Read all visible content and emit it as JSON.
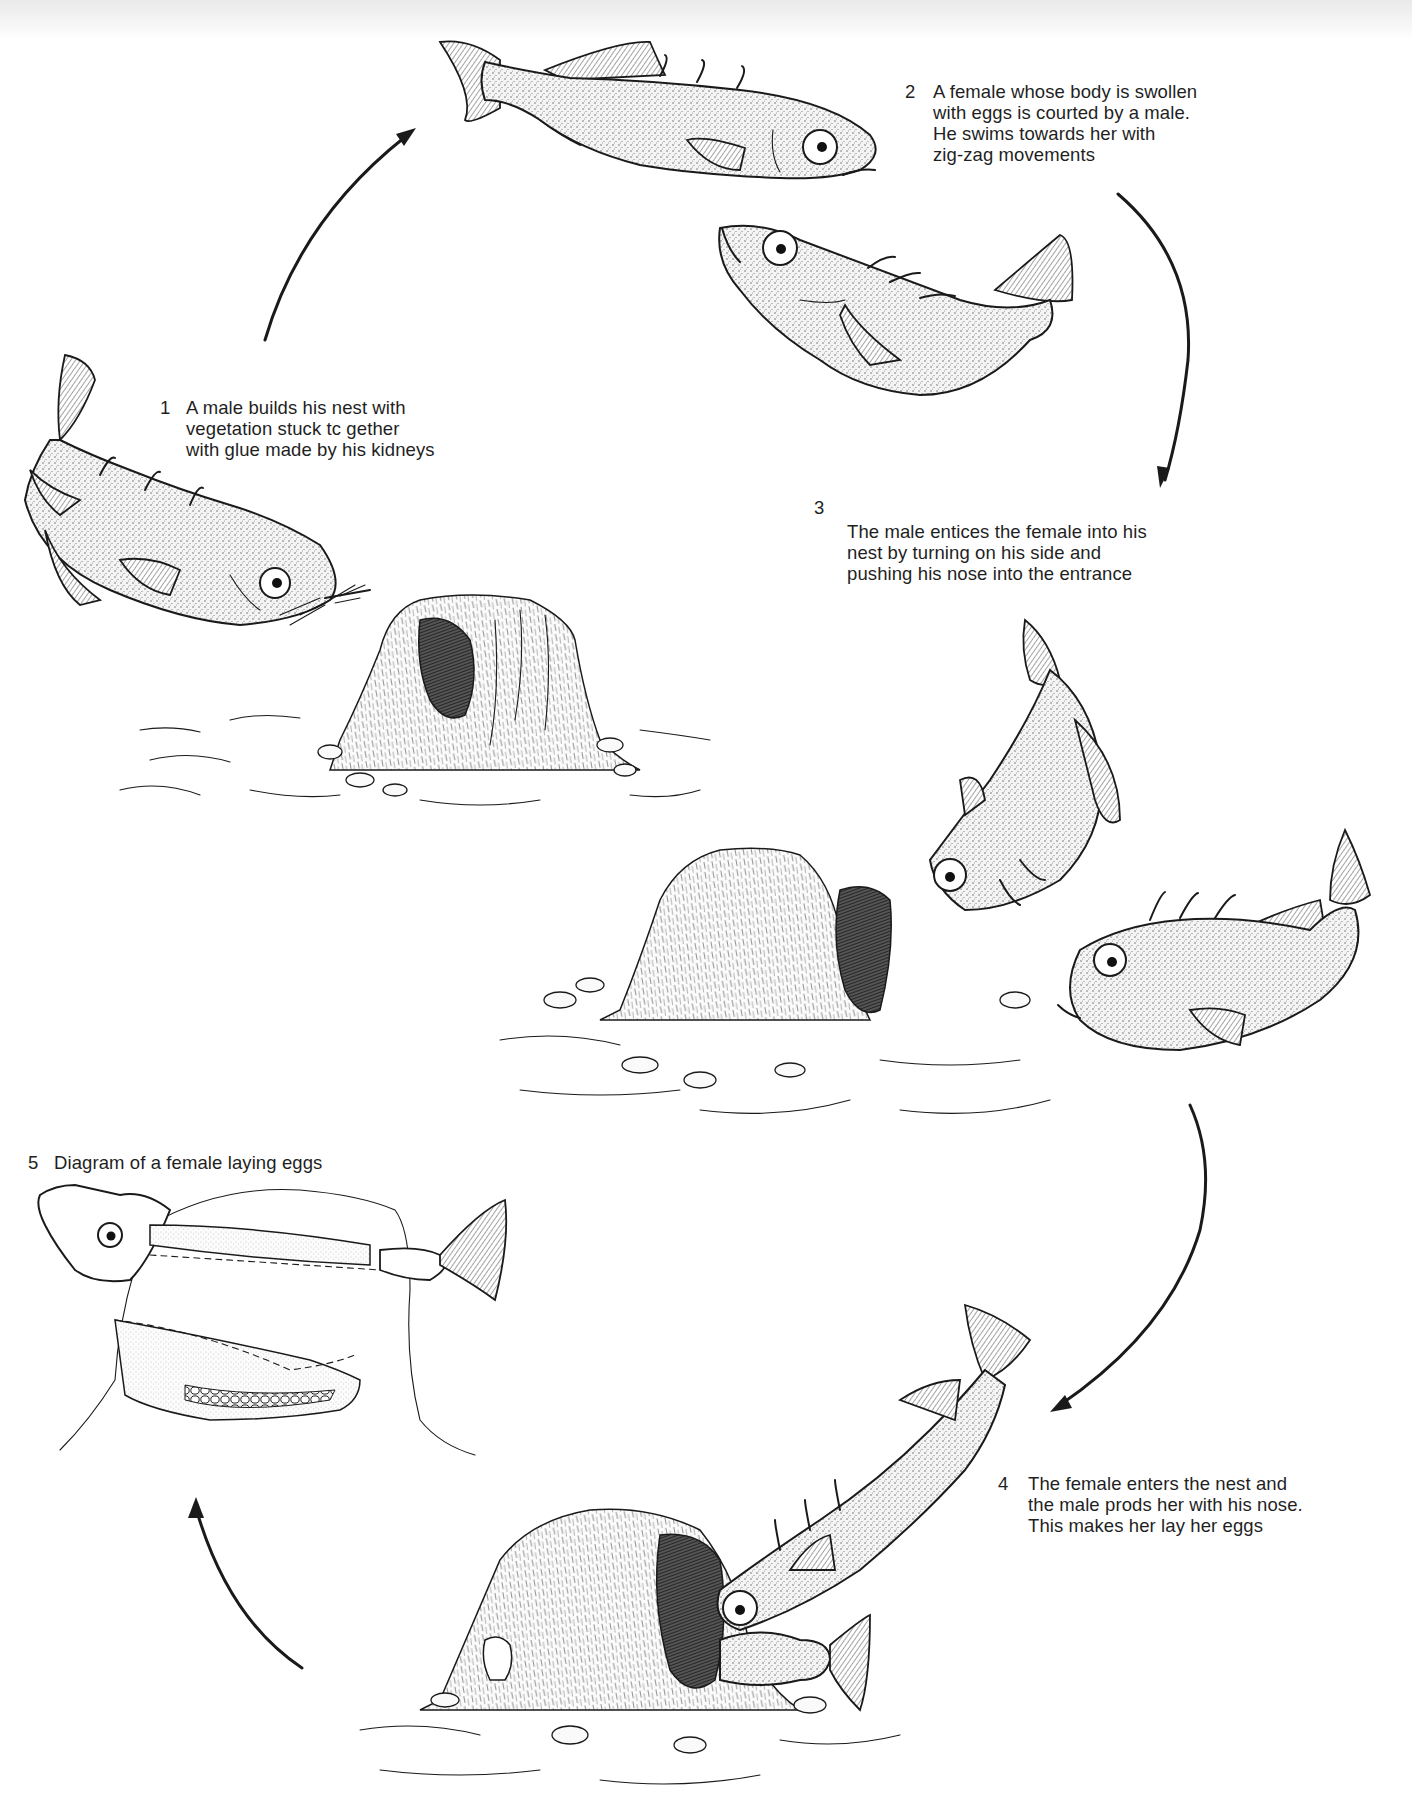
{
  "diagram": {
    "colors": {
      "ink": "#1a1a1a",
      "background": "#ffffff",
      "top_shade": "#e9e9e9"
    },
    "stages": [
      {
        "number": "1",
        "lines": [
          "A male builds his nest with",
          "vegetation stuck tc gether",
          "with glue made by his kidneys"
        ]
      },
      {
        "number": "2",
        "lines": [
          "A female whose body is swollen",
          "with eggs is courted by a male.",
          "He swims towards her with",
          "zig-zag movements"
        ]
      },
      {
        "number": "3",
        "lines": [
          "The male entices the female into his",
          "nest by turning on his side and",
          "pushing his nose into the entrance"
        ]
      },
      {
        "number": "4",
        "lines": [
          "The female enters the nest and",
          "the male prods her with his nose.",
          "This makes her lay her eggs"
        ]
      },
      {
        "number": "5",
        "lines": [
          "Diagram of a female laying eggs"
        ]
      }
    ],
    "arrows": [
      {
        "from": "1",
        "to": "2",
        "icon": "curved-arrow-up-right"
      },
      {
        "from": "2",
        "to": "3",
        "icon": "curved-arrow-down"
      },
      {
        "from": "3",
        "to": "4",
        "icon": "curved-arrow-down-left"
      },
      {
        "from": "4",
        "to": "5",
        "icon": "curved-arrow-up-left"
      }
    ]
  }
}
